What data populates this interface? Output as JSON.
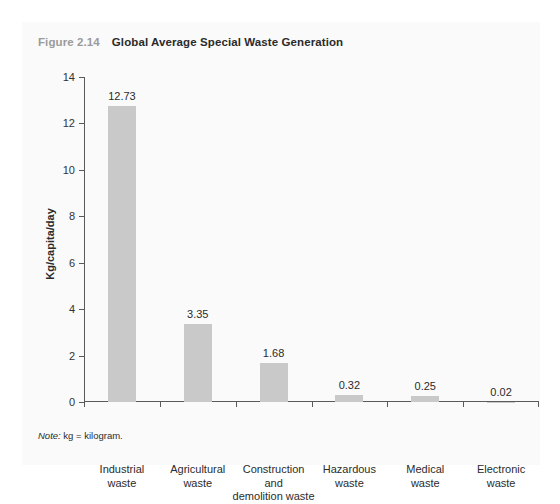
{
  "figure": {
    "number": "Figure 2.14",
    "title": "Global Average Special Waste Generation",
    "note_lead": "Note:",
    "note_text": " kg = kilogram."
  },
  "chart_data": {
    "type": "bar",
    "title": "Global Average Special Waste Generation",
    "xlabel": "",
    "ylabel": "Kg/capita/day",
    "ylim": [
      0,
      14
    ],
    "yticks": [
      0,
      2,
      4,
      6,
      8,
      10,
      12,
      14
    ],
    "ytick_labels": [
      "0",
      "2",
      "4",
      "6",
      "8",
      "10",
      "12",
      "14"
    ],
    "grid": false,
    "legend": false,
    "bar_color": "#c9c9c9",
    "categories": [
      "Industrial waste",
      "Agricultural waste",
      "Construction and demolition waste",
      "Hazardous waste",
      "Medical waste",
      "Electronic waste"
    ],
    "category_lines": [
      [
        "Industrial",
        "waste"
      ],
      [
        "Agricultural",
        "waste"
      ],
      [
        "Construction",
        "and",
        "demolition waste"
      ],
      [
        "Hazardous",
        "waste"
      ],
      [
        "Medical",
        "waste"
      ],
      [
        "Electronic",
        "waste"
      ]
    ],
    "values": [
      12.73,
      3.35,
      1.68,
      0.32,
      0.25,
      0.02
    ],
    "value_labels": [
      "12.73",
      "3.35",
      "1.68",
      "0.32",
      "0.25",
      "0.02"
    ]
  }
}
